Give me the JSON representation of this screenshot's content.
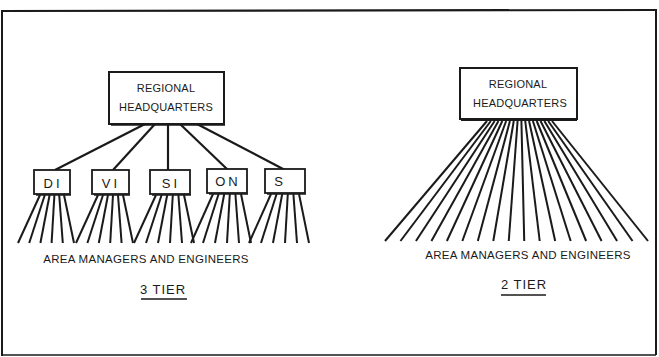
{
  "diagram": {
    "colors": {
      "ink": "#1a1a1a",
      "background": "#ffffff"
    },
    "three_tier": {
      "root": {
        "line1": "REGIONAL",
        "line2": "HEADQUARTERS"
      },
      "divisions": [
        {
          "label": "DI",
          "branches": 6
        },
        {
          "label": "VI",
          "branches": 6
        },
        {
          "label": "SI",
          "branches": 6
        },
        {
          "label": "ON",
          "branches": 6
        },
        {
          "label": "S",
          "branches": 6
        }
      ],
      "leaf_label": "AREA MANAGERS AND ENGINEERS",
      "caption": "3 TIER"
    },
    "two_tier": {
      "root": {
        "line1": "REGIONAL",
        "line2": "HEADQUARTERS"
      },
      "branches": 18,
      "leaf_label": "AREA MANAGERS AND ENGINEERS",
      "caption": "2 TIER"
    }
  }
}
